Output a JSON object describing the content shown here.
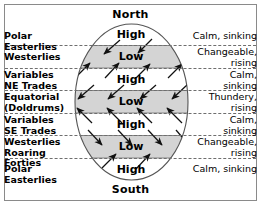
{
  "diagram": {
    "title_north": "North",
    "title_south": "South",
    "shaded_band_color": "#d4d4d4",
    "globe_outline_color": "#555555",
    "separator_color": "#6e6e6e",
    "text_color": "#000000"
  },
  "zones": [
    {
      "name": "polar-easterlies-north",
      "wind_belt": [
        "Polar Easterlies"
      ],
      "weather": [
        "Calm, sinking"
      ],
      "pressure": "High",
      "shaded": false
    },
    {
      "name": "westerlies-north",
      "wind_belt": [
        "Westerlies"
      ],
      "weather": [
        "Changeable,",
        "rising"
      ],
      "pressure": "Low",
      "shaded": true
    },
    {
      "name": "variables-ne-trades",
      "wind_belt": [
        "Variables",
        "NE Trades"
      ],
      "weather": [
        "Calm,",
        "sinking"
      ],
      "pressure": "High",
      "shaded": false
    },
    {
      "name": "equatorial-doldrums",
      "wind_belt": [
        "Equatorial",
        "(Doldrums)"
      ],
      "weather": [
        "Thundery,",
        "rising"
      ],
      "pressure": "Low",
      "shaded": true
    },
    {
      "name": "variables-se-trades",
      "wind_belt": [
        "Variables",
        "SE Trades"
      ],
      "weather": [
        "Calm,",
        "sinking"
      ],
      "pressure": "High",
      "shaded": false
    },
    {
      "name": "westerlies-south-roaring-forties",
      "wind_belt": [
        "Westerlies",
        "Roaring Forties"
      ],
      "weather": [
        "Changeable,",
        "rising"
      ],
      "pressure": "Low",
      "shaded": true
    },
    {
      "name": "polar-easterlies-south",
      "wind_belt": [
        "Polar Easterlies"
      ],
      "weather": [
        "Calm, sinking"
      ],
      "pressure": "High",
      "shaded": false
    }
  ],
  "pressure_labels": {
    "high_north_polar": "High",
    "low_north_westerlies": "Low",
    "high_ne_trades": "High",
    "low_equatorial": "Low",
    "high_se_trades": "High",
    "low_south_westerlies": "Low",
    "high_south_polar": "High"
  }
}
